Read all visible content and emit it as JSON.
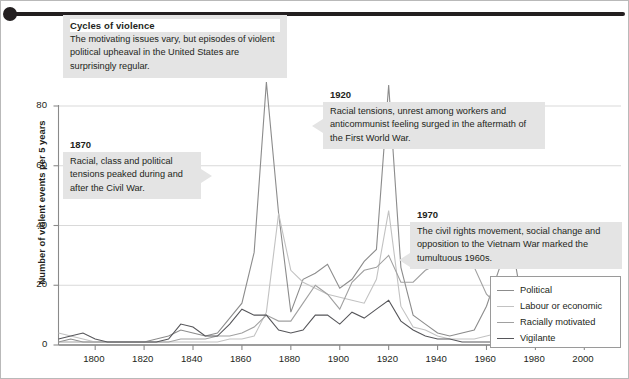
{
  "title_block": {
    "heading": "Cycles of violence",
    "body": "The motivating issues vary, but episodes of violent political upheaval in the United States are surprisingly regular."
  },
  "annotations": [
    {
      "id": "1870",
      "heading": "1870",
      "body": "Racial, class and political tensions peaked during and after the Civil War."
    },
    {
      "id": "1920",
      "heading": "1920",
      "body": "Racial tensions, unrest among workers and anticommunist feeling surged in the aftermath of the First World War."
    },
    {
      "id": "1970",
      "heading": "1970",
      "body": "The civil rights movement, social change and opposition to the Vietnam War marked the tumultuous 1960s."
    }
  ],
  "legend": {
    "position": "bottom-right",
    "items": [
      {
        "label": "Political",
        "color": "#8c8c8c"
      },
      {
        "label": "Labour or economic",
        "color": "#c2c2c2"
      },
      {
        "label": "Racially motivated",
        "color": "#a0a0a0"
      },
      {
        "label": "Vigilante",
        "color": "#56565a"
      }
    ]
  },
  "axes": {
    "y_ticks": [
      "0",
      "20",
      "40",
      "60",
      "80"
    ],
    "x_ticks": [
      "1800",
      "1820",
      "1840",
      "1860",
      "1880",
      "1900",
      "1920",
      "1940",
      "1960",
      "1980",
      "2000"
    ]
  },
  "chart_data": {
    "type": "line",
    "title": "Cycles of violence",
    "xlabel": "",
    "ylabel": "Number of violent events per 5 years",
    "xlim": [
      1785,
      2015
    ],
    "ylim": [
      0,
      90
    ],
    "grid": "horizontal",
    "legend_position": "bottom-right",
    "x": [
      1785,
      1790,
      1795,
      1800,
      1805,
      1810,
      1815,
      1820,
      1825,
      1830,
      1835,
      1840,
      1845,
      1850,
      1855,
      1860,
      1865,
      1870,
      1875,
      1880,
      1885,
      1890,
      1895,
      1900,
      1905,
      1910,
      1915,
      1920,
      1925,
      1930,
      1935,
      1940,
      1945,
      1950,
      1955,
      1960,
      1965,
      1970,
      1975,
      1980,
      1985,
      1990,
      1995,
      2000,
      2005,
      2010
    ],
    "series": [
      {
        "name": "Political",
        "color": "#8c8c8c",
        "values": [
          1,
          2,
          1,
          1,
          1,
          1,
          1,
          1,
          2,
          3,
          5,
          4,
          3,
          4,
          9,
          14,
          31,
          88,
          44,
          11,
          22,
          24,
          27,
          19,
          22,
          28,
          32,
          87,
          26,
          10,
          7,
          4,
          3,
          4,
          5,
          13,
          25,
          36,
          12,
          8,
          6,
          5,
          8,
          6,
          9,
          13
        ]
      },
      {
        "name": "Labour or economic",
        "color": "#c2c2c2",
        "values": [
          4,
          3,
          2,
          1,
          1,
          1,
          1,
          1,
          1,
          1,
          1,
          1,
          1,
          1,
          2,
          2,
          3,
          11,
          44,
          25,
          21,
          19,
          17,
          16,
          15,
          14,
          22,
          45,
          13,
          6,
          5,
          3,
          2,
          2,
          2,
          3,
          4,
          6,
          4,
          3,
          3,
          2,
          3,
          3,
          3,
          3
        ]
      },
      {
        "name": "Racially motivated",
        "color": "#a0a0a0",
        "values": [
          1,
          1,
          1,
          1,
          1,
          1,
          1,
          1,
          1,
          1,
          2,
          2,
          2,
          3,
          3,
          4,
          6,
          10,
          8,
          8,
          14,
          20,
          17,
          12,
          21,
          25,
          26,
          30,
          21,
          21,
          25,
          27,
          32,
          30,
          26,
          17,
          13,
          8,
          5,
          4,
          4,
          5,
          5,
          6,
          7,
          8
        ]
      },
      {
        "name": "Vigilante",
        "color": "#56565a",
        "values": [
          2,
          3,
          4,
          2,
          1,
          1,
          1,
          1,
          1,
          2,
          7,
          6,
          3,
          3,
          7,
          12,
          10,
          10,
          5,
          4,
          5,
          10,
          10,
          7,
          11,
          9,
          12,
          15,
          8,
          5,
          3,
          2,
          2,
          1,
          1,
          1,
          1,
          1,
          1,
          1,
          1,
          1,
          1,
          1,
          2,
          2
        ]
      }
    ]
  }
}
